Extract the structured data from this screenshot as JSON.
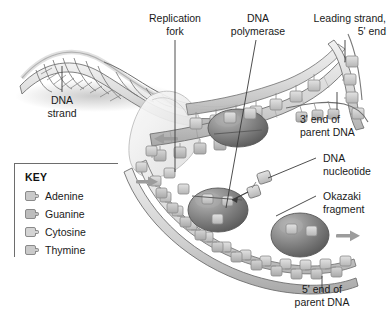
{
  "figure": {
    "background_color": "#ffffff",
    "ink_color": "#1a1a1a"
  },
  "labels": [
    {
      "id": "dna-strand",
      "text": "DNA\nstrand",
      "x": 35,
      "y": 94,
      "align": "center",
      "width": 54
    },
    {
      "id": "replication-fork",
      "text": "Replication\nfork",
      "x": 137,
      "y": 12,
      "align": "center",
      "width": 76
    },
    {
      "id": "dna-polymerase",
      "text": "DNA\npolymerase",
      "x": 218,
      "y": 12,
      "align": "center",
      "width": 80
    },
    {
      "id": "leading-strand",
      "text": "Leading strand,\n5' end",
      "x": 300,
      "y": 12,
      "align": "right",
      "width": 86
    },
    {
      "id": "three-prime-end",
      "text": "3' end of\nparent DNA",
      "x": 300,
      "y": 113,
      "align": "left",
      "width": 86
    },
    {
      "id": "dna-nucleotide",
      "text": "DNA\nnucleotide",
      "x": 323,
      "y": 152,
      "align": "left",
      "width": 66
    },
    {
      "id": "okazaki-fragment",
      "text": "Okazaki\nfragment",
      "x": 323,
      "y": 190,
      "align": "left",
      "width": 66
    },
    {
      "id": "five-prime-end",
      "text": "5' end of\nparent DNA",
      "x": 288,
      "y": 283,
      "align": "center",
      "width": 96
    }
  ],
  "key": {
    "title": "KEY",
    "items": [
      {
        "label": "Adenine",
        "color": "#c9c9c9"
      },
      {
        "label": "Guanine",
        "color": "#bdbdbd"
      },
      {
        "label": "Cytosine",
        "color": "#d4d4d4"
      },
      {
        "label": "Thymine",
        "color": "#cacaca"
      }
    ]
  },
  "diagram": {
    "colors": {
      "helix_stroke": "#6f6f6f",
      "helix_fill": "#e6e6e6",
      "base_fill": "#c9c9c9",
      "base_stroke": "#8c8c8c",
      "enzyme_fill": "#8e8e8e",
      "enzyme_stroke": "#5a5a5a",
      "leader_line": "#3a3a3a",
      "arrow": "#9a9a9a"
    },
    "enzymes": [
      {
        "name": "dna-polymerase-leading",
        "cx": 238,
        "cy": 128,
        "rx": 30,
        "ry": 19
      },
      {
        "name": "dna-polymerase-lagging-upper",
        "cx": 218,
        "cy": 210,
        "rx": 30,
        "ry": 22
      },
      {
        "name": "dna-polymerase-lagging-lower",
        "cx": 300,
        "cy": 235,
        "rx": 29,
        "ry": 22
      }
    ],
    "arrows": [
      {
        "name": "leading-strand-arrow",
        "x": 166,
        "y": 139,
        "direction": "left"
      },
      {
        "name": "lagging-strand-arrow-upper",
        "x": 143,
        "y": 182,
        "direction": "right"
      },
      {
        "name": "okazaki-arrow",
        "x": 345,
        "y": 236,
        "direction": "right"
      }
    ]
  }
}
